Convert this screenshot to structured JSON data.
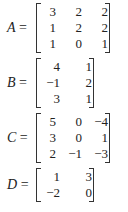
{
  "matrices": [
    {
      "name": "A",
      "rows": [
        [
          "3",
          "2",
          "2"
        ],
        [
          "1",
          "2",
          "2"
        ],
        [
          "1",
          "0",
          "1"
        ]
      ]
    },
    {
      "name": "B",
      "rows": [
        [
          "4",
          "1"
        ],
        [
          "−1",
          "2"
        ],
        [
          "3",
          "1"
        ]
      ]
    },
    {
      "name": "C",
      "rows": [
        [
          "5",
          "0",
          "−4"
        ],
        [
          "3",
          "0",
          "1"
        ],
        [
          "2",
          "−1",
          "−3"
        ]
      ]
    },
    {
      "name": "D",
      "rows": [
        [
          "1",
          "3"
        ],
        [
          "−2",
          "0"
        ]
      ]
    }
  ],
  "equals_sign": "="
}
